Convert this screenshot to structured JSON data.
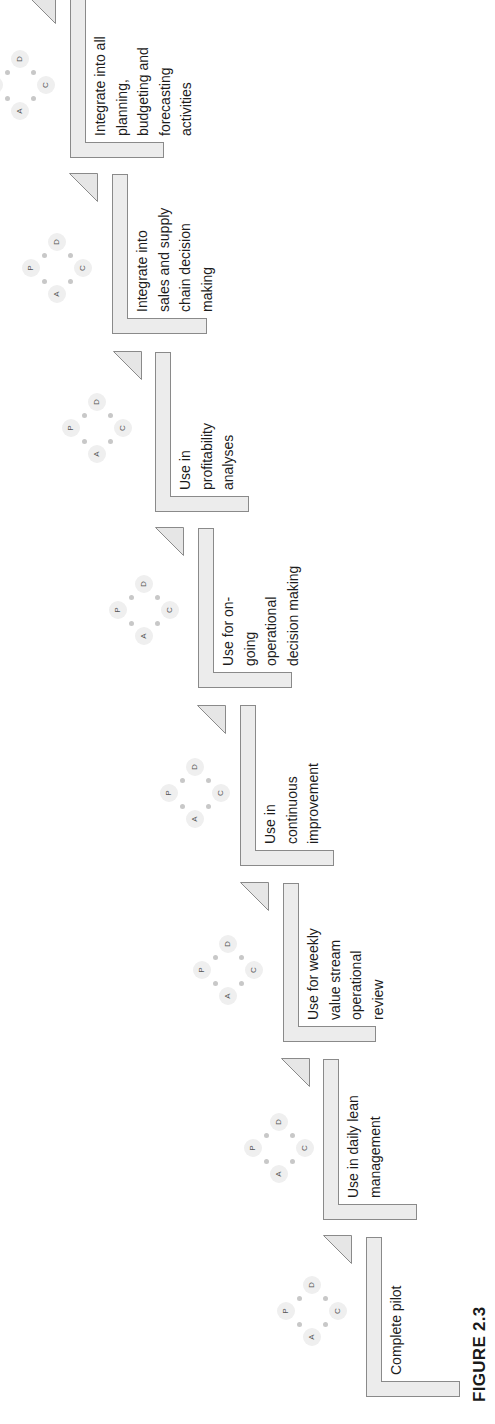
{
  "figure": {
    "caption": "FIGURE 2.3",
    "orientation": "rotated 90° counter-clockwise (read bottom-to-top)",
    "colors": {
      "bracket_fill": "#ececec",
      "bracket_border": "#8a8a8a",
      "triangle_fill": "#e6e6e6",
      "pdca_circle": "#efefef",
      "pdca_dot": "#c8c8c8",
      "text": "#1c1c1c"
    },
    "pdca_labels": {
      "plan": "P",
      "do": "D",
      "check": "C",
      "act": "A"
    },
    "steps": [
      {
        "order": 1,
        "label": "Complete pilot",
        "lines": [
          "Complete pilot"
        ]
      },
      {
        "order": 2,
        "label": "Use in daily lean management",
        "lines": [
          "Use in daily lean",
          "management"
        ]
      },
      {
        "order": 3,
        "label": "Use for weekly value stream operational review",
        "lines": [
          "Use for weekly",
          "value stream",
          "operational",
          "review"
        ]
      },
      {
        "order": 4,
        "label": "Use in continuous improvement",
        "lines": [
          "Use in",
          "continuous",
          "improvement"
        ]
      },
      {
        "order": 5,
        "label": "Use for on-going operational decision making",
        "lines": [
          "Use for on-",
          "going",
          "operational",
          "decision making"
        ]
      },
      {
        "order": 6,
        "label": "Use in profitability analyses",
        "lines": [
          "Use in",
          "profitability",
          "analyses"
        ]
      },
      {
        "order": 7,
        "label": "Integrate into sales and supply chain decision making",
        "lines": [
          "Integrate into",
          "sales and supply",
          "chain decision",
          "making"
        ]
      },
      {
        "order": 8,
        "label": "Integrate into all planning, budgeting and forecasting activities",
        "lines": [
          "Integrate into all",
          "planning,",
          "budgeting and",
          "forecasting",
          "activities"
        ]
      }
    ]
  }
}
